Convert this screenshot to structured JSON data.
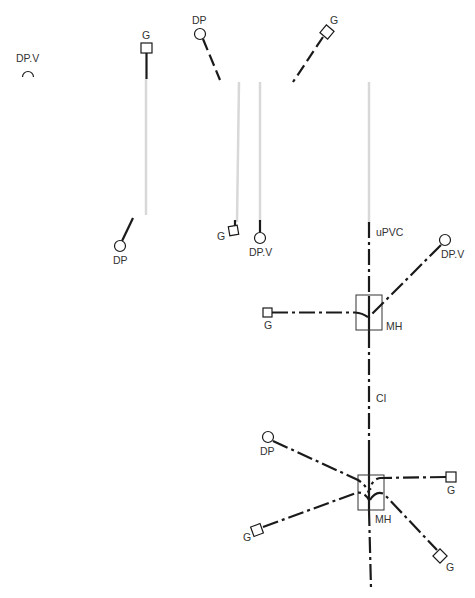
{
  "labels": {
    "dpv_isolated": "DP.V",
    "g_top_left": "G",
    "dp_top": "DP",
    "g_top_right": "G",
    "dp_lower_left": "DP",
    "g_mid": "G",
    "dpv_mid": "DP.V",
    "upvc": "uPVC",
    "dpv_right": "DP.V",
    "g_mh1": "G",
    "mh1": "MH",
    "ci": "CI",
    "dp_mh2": "DP",
    "g_mh2_right": "G",
    "mh2": "MH",
    "g_mh2_left": "G",
    "g_mh2_bottom": "G"
  },
  "legend": {
    "DP": "Down pipe (circle symbol)",
    "DP.V": "Down pipe / vent (circle symbol)",
    "G": "Gully (square symbol)",
    "MH": "Manhole (rectangle)",
    "uPVC": "Pipe material upstream",
    "CI": "Pipe material downstream"
  },
  "colors": {
    "line": "#1a1a1a",
    "faint_line": "#d8d8d8",
    "text": "#333333",
    "background": "#ffffff"
  }
}
